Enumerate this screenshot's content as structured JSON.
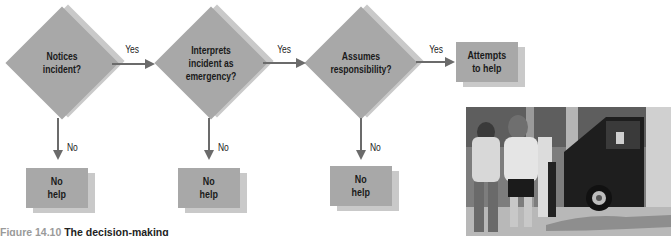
{
  "diagram": {
    "decisions": [
      {
        "label": "Notices\nincident?"
      },
      {
        "label": "Interprets\nincident as\nemergency?"
      },
      {
        "label": "Assumes\nresponsibility?"
      }
    ],
    "outcome_yes": {
      "label": "Attempts\nto help"
    },
    "outcome_no": [
      {
        "label": "No\nhelp"
      },
      {
        "label": "No\nhelp"
      },
      {
        "label": "No\nhelp"
      }
    ],
    "edge_labels": {
      "yes": "Yes",
      "no": "No"
    }
  },
  "caption": {
    "figure_number": "Figure 14.10",
    "title": "The decision-making"
  },
  "photo": {
    "description": "People walking past a person lying on the sidewalk next to a van"
  }
}
